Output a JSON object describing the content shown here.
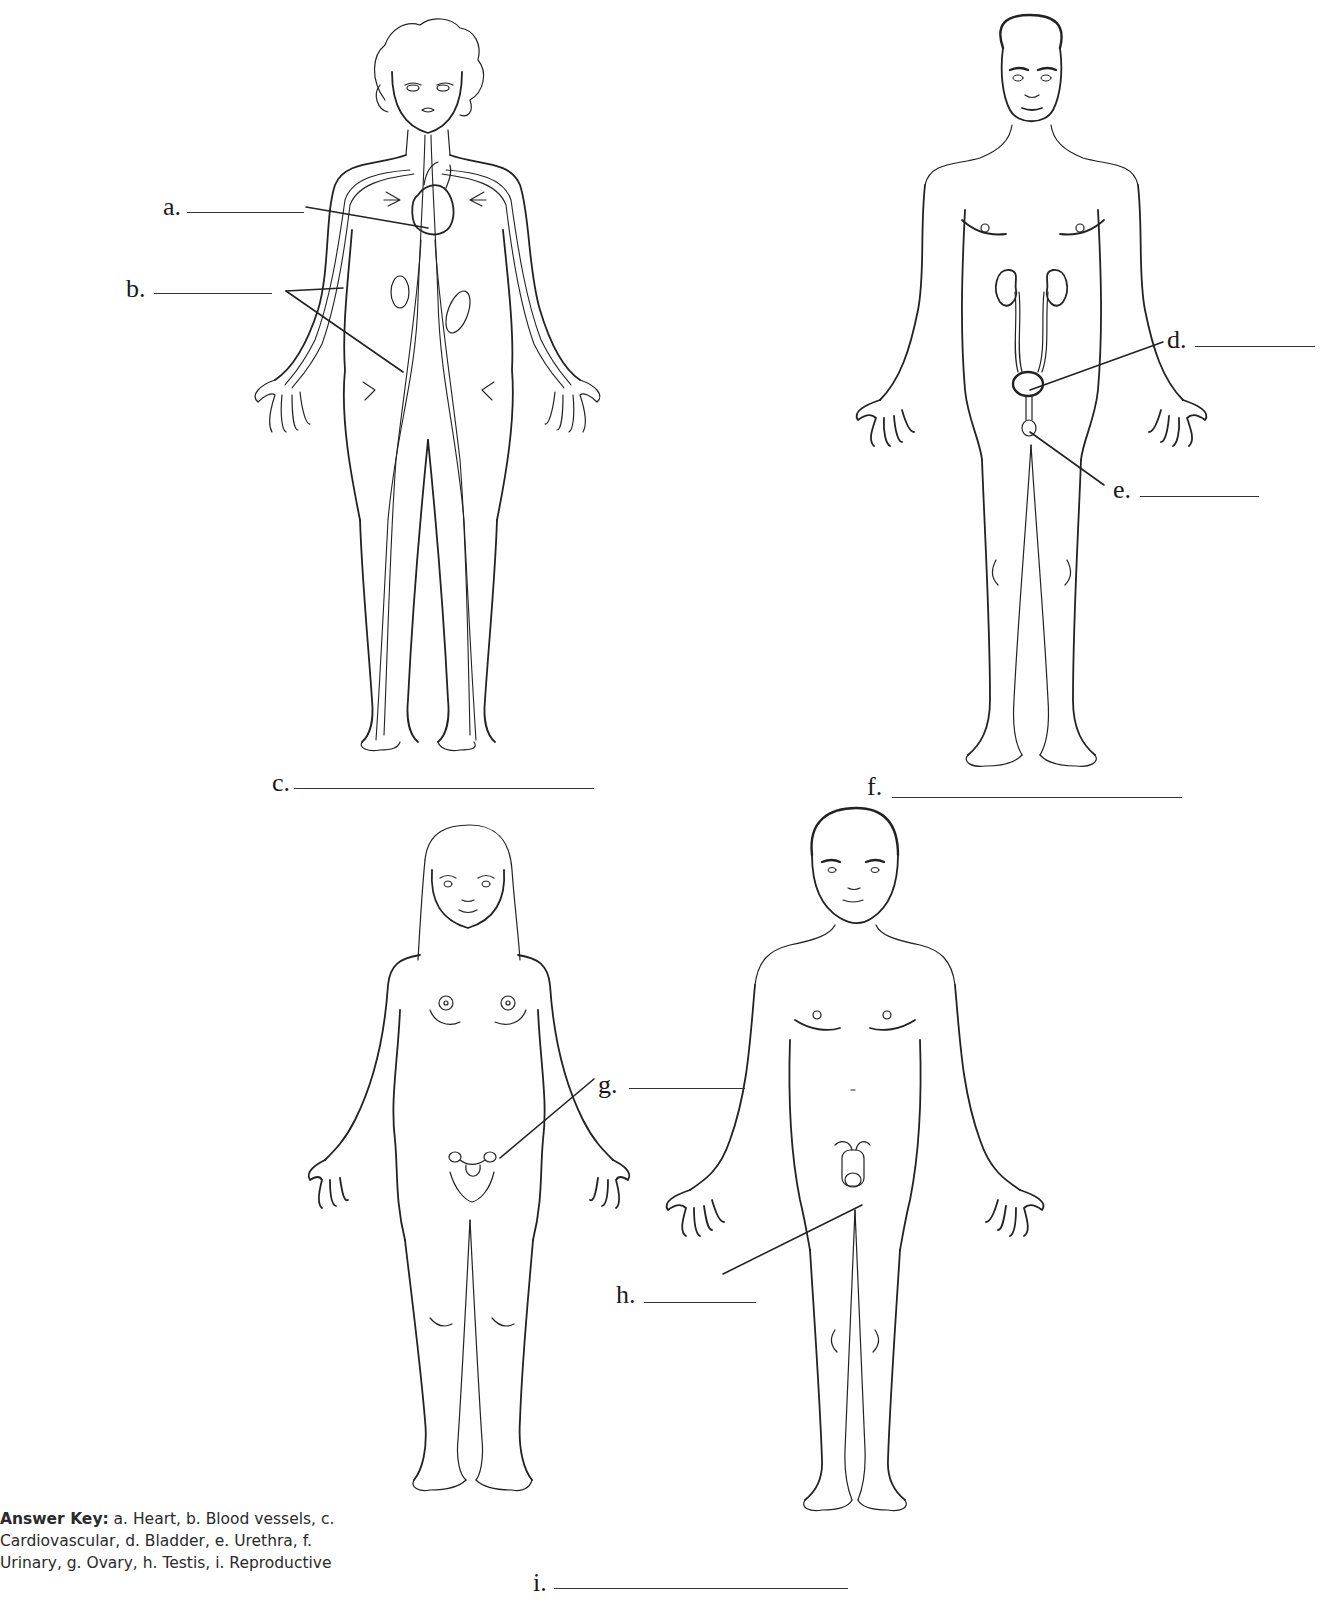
{
  "worksheet": {
    "figures": [
      {
        "id": "cardiovascular-figure",
        "description": "female body with heart and blood vessels"
      },
      {
        "id": "urinary-figure",
        "description": "male body with kidneys, ureters, bladder, urethra"
      },
      {
        "id": "female-reproductive-figure",
        "description": "female body with ovaries and uterus"
      },
      {
        "id": "male-reproductive-figure",
        "description": "male body with testis"
      }
    ],
    "labels": {
      "a": "a.",
      "b": "b.",
      "c": "c.",
      "d": "d.",
      "e": "e.",
      "f": "f.",
      "g": "g.",
      "h": "h.",
      "i": "i."
    },
    "answer_key": {
      "title": "Answer Key:",
      "text": " a. Heart, b. Blood vessels, c. Cardiovascular, d. Bladder, e. Urethra, f. Urinary, g. Ovary, h. Testis, i. Reproductive"
    }
  }
}
